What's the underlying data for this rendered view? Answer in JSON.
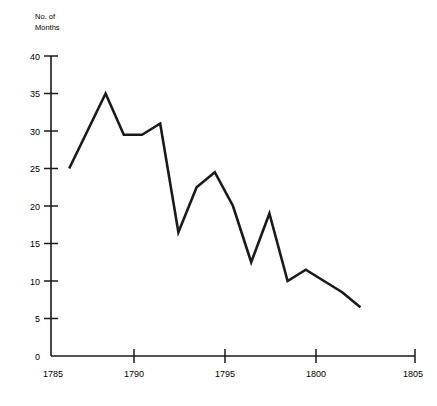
{
  "chart_data": {
    "type": "line",
    "title": "",
    "subtitle": "",
    "xlabel": "",
    "ylabel": "No. of\nMonths",
    "ylabel_line1": "No. of",
    "ylabel_line2": "Months",
    "xlim": [
      1785,
      1805
    ],
    "ylim": [
      0,
      40
    ],
    "xticks": [
      1785,
      1790,
      1795,
      1800,
      1805
    ],
    "xtick_labels": [
      "1785",
      "1790",
      "1795",
      "1800",
      "1805"
    ],
    "yticks": [
      0,
      5,
      10,
      15,
      20,
      25,
      30,
      35,
      40
    ],
    "ytick_labels": [
      "0",
      "5",
      "10",
      "15",
      "20",
      "25",
      "30",
      "35",
      "40"
    ],
    "grid": false,
    "legend": false,
    "legend_position": "none",
    "line_color": "#1a1a1a",
    "line_width": 2.6,
    "axis_color": "#1a1a1a",
    "background_color": "#ffffff",
    "x": [
      1786,
      1787,
      1788,
      1789,
      1790,
      1791,
      1792,
      1793,
      1794,
      1795,
      1796,
      1797,
      1798,
      1799,
      1800,
      1801,
      1802
    ],
    "values": [
      25,
      30,
      35,
      29.5,
      29.5,
      31,
      16.5,
      22.5,
      24.5,
      20,
      12.5,
      19,
      10,
      11.5,
      10,
      8.5,
      6.5
    ],
    "series": [
      {
        "name": "No. of Months",
        "x": [
          1786,
          1787,
          1788,
          1789,
          1790,
          1791,
          1792,
          1793,
          1794,
          1795,
          1796,
          1797,
          1798,
          1799,
          1800,
          1801,
          1802
        ],
        "values": [
          25,
          30,
          35,
          29.5,
          29.5,
          31,
          16.5,
          22.5,
          24.5,
          20,
          12.5,
          19,
          10,
          11.5,
          10,
          8.5,
          6.5
        ]
      }
    ],
    "annotations": []
  }
}
